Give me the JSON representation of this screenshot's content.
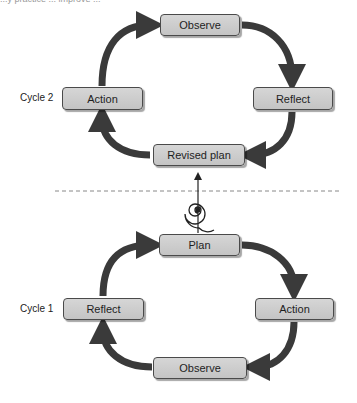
{
  "header": {
    "cropped_text": "...y practice ... improve ... "
  },
  "colors": {
    "arrow": "#3a3a3a",
    "box_fill": "#cccccc",
    "box_border": "#4a4a4a",
    "divider": "#888888"
  },
  "cycle2": {
    "label": "Cycle 2",
    "nodes": {
      "observe": "Observe",
      "reflect": "Reflect",
      "revised_plan": "Revised plan",
      "action": "Action"
    }
  },
  "cycle1": {
    "label": "Cycle 1",
    "nodes": {
      "plan": "Plan",
      "action": "Action",
      "observe": "Observe",
      "reflect": "Reflect"
    }
  },
  "connector": {
    "icon": "spiral-icon",
    "direction": "up"
  }
}
